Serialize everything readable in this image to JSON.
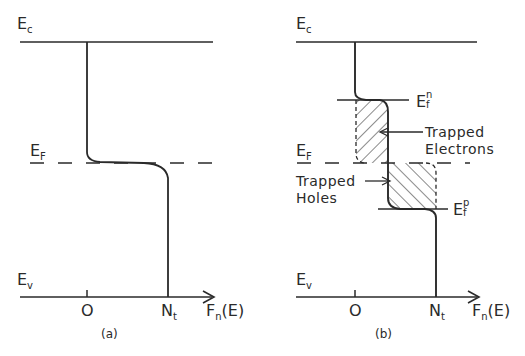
{
  "figure": {
    "panels": [
      {
        "id": "a",
        "caption": "(a)",
        "energy_levels": {
          "conduction_band": {
            "symbol": "E",
            "subscript": "c"
          },
          "fermi_level": {
            "symbol": "E",
            "subscript": "F"
          },
          "valence_band": {
            "symbol": "E",
            "subscript": "v"
          }
        },
        "x_axis": {
          "label_main": "F",
          "label_sub": "n",
          "label_rest": "(E)",
          "ticks": [
            {
              "label": "O"
            },
            {
              "label_main": "N",
              "label_sub": "t"
            }
          ]
        }
      },
      {
        "id": "b",
        "caption": "(b)",
        "energy_levels": {
          "conduction_band": {
            "symbol": "E",
            "subscript": "c"
          },
          "fermi_level": {
            "symbol": "E",
            "subscript": "F"
          },
          "valence_band": {
            "symbol": "E",
            "subscript": "v"
          },
          "quasi_fermi_n": {
            "symbol": "E",
            "subscript": "f",
            "superscript": "n"
          },
          "quasi_fermi_p": {
            "symbol": "E",
            "subscript": "f",
            "superscript": "p"
          }
        },
        "x_axis": {
          "label_main": "F",
          "label_sub": "n",
          "label_rest": "(E)",
          "ticks": [
            {
              "label": "O"
            },
            {
              "label_main": "N",
              "label_sub": "t"
            }
          ]
        },
        "annotations": {
          "trapped_electrons_line1": "Trapped",
          "trapped_electrons_line2": "Electrons",
          "trapped_holes_line1": "Trapped",
          "trapped_holes_line2": "Holes"
        }
      }
    ],
    "colors": {
      "ink": "#2a2a2a",
      "background": "#ffffff"
    }
  }
}
